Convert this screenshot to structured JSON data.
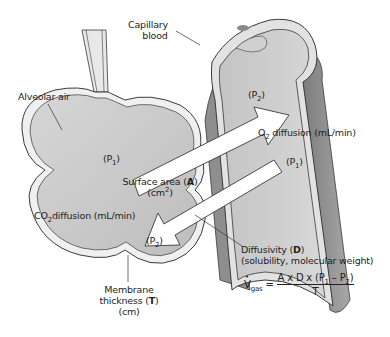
{
  "diagram": {
    "type": "alveolar-capillary gas diffusion",
    "labels": {
      "capillary_blood_line1": "Capillary",
      "capillary_blood_line2": "blood",
      "alveolar_air": "Alveolar air",
      "o2_p2": "(P",
      "o2_p2_sub": "2",
      "o2_p2_close": ")",
      "o2_p1": "(P",
      "o2_p1_sub": "1",
      "o2_p1_close": ")",
      "o2_diffusion_pre": "O",
      "o2_diffusion_sub": "2",
      "o2_diffusion_post": " diffusion (mL/min)",
      "surface_area_pre": "Surface area (",
      "surface_area_bold": "A",
      "surface_area_post": ")",
      "surface_area_unit_pre": "(cm",
      "surface_area_unit_sup": "2",
      "surface_area_unit_post": ")",
      "co2_p1": "(P",
      "co2_p1_sub": "1",
      "co2_p1_close": ")",
      "co2_p2": "(P",
      "co2_p2_sub": "2",
      "co2_p2_close": ")",
      "co2_diffusion_pre": "CO",
      "co2_diffusion_sub": "2",
      "co2_diffusion_post": "diffusion (mL/min)",
      "diffusivity_pre": "Diffusivity (",
      "diffusivity_bold": "D",
      "diffusivity_post": ")",
      "diffusivity_detail": "(solubility, molecular weight)",
      "membrane_line1": "Membrane",
      "membrane_line2_pre": "thickness (",
      "membrane_line2_bold": "T",
      "membrane_line2_post": ")",
      "membrane_unit": "(cm)"
    },
    "equation": {
      "lhs_v": "V",
      "lhs_sub": "gas",
      "equals": " = ",
      "numerator_pre": "A x D x (P",
      "numerator_sub1": "1",
      "numerator_mid": " – P",
      "numerator_sub2": "2",
      "numerator_post": ")",
      "denominator": "T"
    },
    "colors": {
      "fill_gray": "#c8c8c8",
      "fill_light": "#e6e6e6",
      "outline": "#3a3a3a",
      "wall_dark": "#8a8a8a",
      "arrow_fill": "#ffffff"
    }
  }
}
